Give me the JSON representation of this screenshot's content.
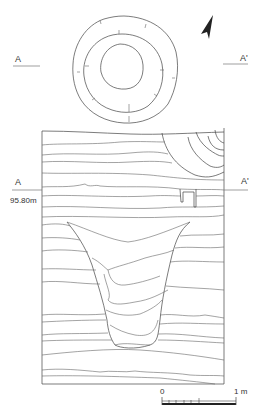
{
  "figure": {
    "type": "archaeological pit plan and section drawing",
    "plan": {
      "section_line": {
        "start_label": "A",
        "end_label": "A'"
      }
    },
    "section": {
      "start_label": "A",
      "end_label": "A'",
      "elevation_label": "95.80m"
    },
    "north_arrow": {
      "icon": "north-arrow-icon"
    },
    "scale_bar": {
      "start_label": "0",
      "end_label": "1 m",
      "subdivisions": 5
    },
    "colors": {
      "line": "#444444",
      "background": "#ffffff"
    }
  }
}
